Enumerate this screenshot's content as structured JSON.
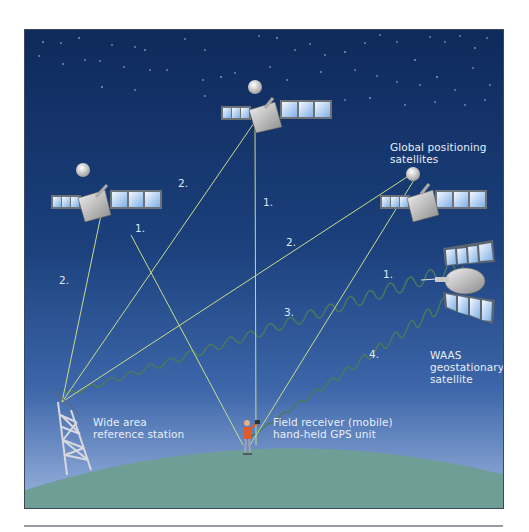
{
  "labels": {
    "gps_satellites": [
      "Global positioning",
      "satellites"
    ],
    "waas_satellite": [
      "WAAS",
      "geostationary",
      "satellite"
    ],
    "reference_station": [
      "Wide area",
      "reference station"
    ],
    "field_receiver": [
      "Field receiver (mobile)",
      "hand-held GPS unit"
    ]
  },
  "signal_numbers": {
    "left_sat_to_station": "2.",
    "left_sat_to_receiver": "1.",
    "top_sat_to_station": "2.",
    "top_sat_to_receiver": "1.",
    "right_sat_to_station": "2.",
    "right_sat_to_receiver": "1.",
    "station_to_waas": "3.",
    "waas_to_receiver": "4."
  },
  "colors": {
    "sky_top": "#0f2a5c",
    "sky_mid": "#1f4a8a",
    "sky_bottom": "#8fa8d8",
    "ground": "#6e9e96",
    "signal_line": "#c8dc8a",
    "correction_wave": "#4f7a5a",
    "label_text": "#e6eef8"
  }
}
